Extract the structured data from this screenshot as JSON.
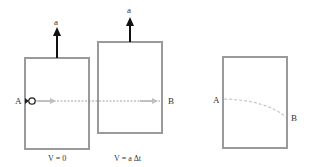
{
  "panels": [
    {
      "id": "elevator-at-rest",
      "arrow_label": "a",
      "caption": "V = 0",
      "point_a": "A"
    },
    {
      "id": "elevator-moving",
      "arrow_label": "a",
      "caption": "V = a Δt",
      "point_b": "B"
    },
    {
      "id": "elevator-frame-view",
      "point_a": "A",
      "point_b": "B"
    }
  ],
  "colors": {
    "box_stroke": "#9a9a9a",
    "arrow": "#111111",
    "ray": "#b8b8b8",
    "dashed_line": "#888888",
    "curved_path": "#c8c8c8"
  }
}
